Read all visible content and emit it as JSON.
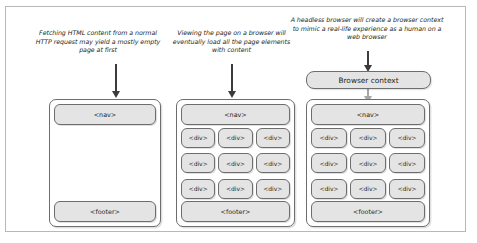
{
  "captions": [
    {
      "id": "caption-1",
      "text": "Fetching HTML content from a normal HTTP request may yield a mostly empty page at first"
    },
    {
      "id": "caption-2",
      "text": "Viewing the page on a browser will eventually load all the page elements with content"
    },
    {
      "id": "caption-3",
      "text": "A headless browser will create a browser context to mimic a real-life experience as a human on a web browser"
    }
  ],
  "browser_context": {
    "label": "Browser context"
  },
  "labels": {
    "nav": "<nav>",
    "footer": "<footer>",
    "div": "<div>"
  },
  "panels": [
    {
      "id": "panel-1",
      "name": "empty-page-panel",
      "nav": "<nav>",
      "footer": "<footer>",
      "grid_rows": 0,
      "grid_cols": 0
    },
    {
      "id": "panel-2",
      "name": "loaded-page-panel",
      "nav": "<nav>",
      "footer": "<footer>",
      "grid_rows": 3,
      "grid_cols": 3
    },
    {
      "id": "panel-3",
      "name": "headless-browser-page-panel",
      "nav": "<nav>",
      "footer": "<footer>",
      "grid_rows": 3,
      "grid_cols": 3
    }
  ],
  "arrows": [
    {
      "id": "arrow-1",
      "name": "arrow-to-empty-page",
      "style": "dark"
    },
    {
      "id": "arrow-2",
      "name": "arrow-to-loaded-page",
      "style": "dark"
    },
    {
      "id": "arrow-3",
      "name": "arrow-to-browser-context",
      "style": "dark"
    },
    {
      "id": "arrow-4",
      "name": "arrow-browser-context-to-page",
      "style": "grey"
    }
  ],
  "colors": {
    "box_fill": "#e4e4e4",
    "box_border": "#6d6d6d",
    "arrow_dark": "#3b3b3b",
    "arrow_grey": "#a6a6a6",
    "frame_border": "#b8b8b8",
    "text": "#231f20"
  }
}
